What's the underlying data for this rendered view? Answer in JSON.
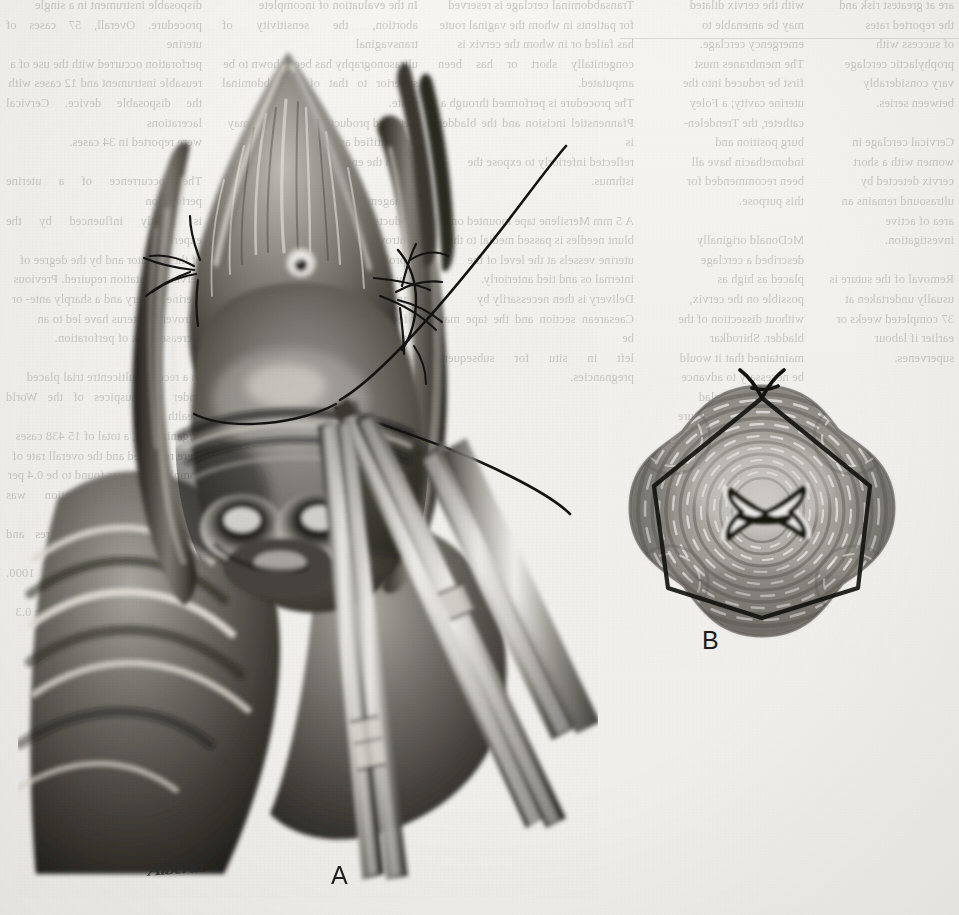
{
  "figure": {
    "kind": "surgical-illustration",
    "medium": "graphite / carbon-dust drawing, grayscale halftone scan",
    "artist_signature": "Alberta.",
    "background_color": "#f1f0ec",
    "ink_color": "#1d1d1d"
  },
  "panels": [
    {
      "id": "A",
      "label": "A",
      "caption": "Operative field view: the vaginal mucosa is retracted, a curved needle carries the monofilament suture through the cervical stroma, and a tissue forceps and retractor hold the anterior lip.",
      "elements": [
        "retracted-vaginal-wall",
        "anterior-cervical-lip",
        "external-os",
        "suture-thread",
        "needle-pass-left",
        "needle-pass-right",
        "tissue-forceps",
        "retractor-blade",
        "posterior-vaginal-wall"
      ]
    },
    {
      "id": "B",
      "label": "B",
      "caption": "Cross-section of the cervix showing the completed purse-string suture encircling the cervical stroma with the stellate external os at the centre.",
      "elements": [
        "cervical-stroma-cross-section",
        "external-os-stellate",
        "encircling-purse-string-suture",
        "suture-knot-tails"
      ]
    }
  ],
  "labels": {
    "a": "A",
    "b": "B"
  },
  "show_through_text": {
    "note": "Faint mirror-image bleed-through of the printed text on the reverse of the page.",
    "col1": "disposable instrument in a single\nprocedure. Overall, 57 cases of uterine\nperforation occurred with the use of a\nreusable instrument and 12 cases with\nthe disposable device. Cervical lacerations\nwere reported in 34 cases.\n\nThe occurrence of a uterine perforation\nis greatly influenced by the experience\nof the operator and by the degree of\ncervical dilatation required. Previous\nuterine surgery and a sharply ante- or\nretroverted uterus have led to an\nincreased risk of perforation.\n\nIn a recent multicentre trial placed\nunder the auspices of the World Health\nOrganization, a total of 15 438 cases\nwere reviewed and the overall rate of\ncomplications was found to be 0.4 per\ncent. Uterine perforation was recorded\nin 1.2 per 1000 procedures and cervical\nlaceration in 1.6 per 1000. Haemorrhage\nrequiring transfusion occurred in 0.3\nper 1000 cases studied.",
    "col2": "In the evaluation of incomplete\nabortion, the sensitivity of transvaginal\nultrasonography has been shown to be\nsuperior to that of the abdominal route.\nRetained products of conception may\nbe identified as an echogenic mass\nwithin the endometrial cavity.\n\nManagement of suspected retained\nproducts of conception remains\ncontroversial. A conservative approach\nmay be adopted in the absence of\nsignificant bleeding or evidence of\ninfection. Surgical evacuation remains\nthe standard treatment when\nhaemorrhage is heavy or when sepsis\nsupervenes.\n\nAntibiotic prophylaxis before\nevacuation of the uterus reduces the\nrisk of post-abortal pelvic infection and\nshould be considered in all patients\nundergoing the procedure.",
    "col3": "Transabdominal cerclage is reserved\nfor patients in whom the vaginal route\nhas failed or in whom the cervix is\ncongenitally short or has been amputated.\nThe procedure is performed through a\nPfannenstiel incision and the bladder is\nreflected inferiorly to expose the\nisthmus.\n\nA 5 mm Mersilene tape mounted on\nblunt needles is passed medial to the\nuterine vessels at the level of the\ninternal os and tied anteriorly.\nDelivery is then necessarily by\nCaesarean section and the tape may be\nleft in situ for subsequent pregnancies.",
    "col4": "with the cervix dilated\nmay be amenable to\nemergency cerclage.\nThe membranes must\nfirst be reduced into the\nuterine cavity; a Foley\ncatheter, the Trendelen-\nburg position and\nindomethacin have all\nbeen recommended for\nthis purpose.\n\nMcDonald originally\ndescribed a cerclage\nplaced as high as\npossible on the cervix,\nwithout dissection of the\nbladder. Shirodkar\nmaintained that it would\nbe necessary to advance\nthe bladder cephalad\nbefore placing the suture\nat the level of the\ninternal os.",
    "col5": "are at greatest risk and\nthe reported rates\nof success with\nprophylactic cerclage\nvary considerably\nbetween series.\n\nCervical cerclage in\nwomen with a short\ncervix detected by\nultrasound remains an\narea of active\ninvestigation.\n\nRemoval of the suture is\nusually undertaken at\n37 completed weeks or\nearlier if labour\nsupervenes."
  }
}
